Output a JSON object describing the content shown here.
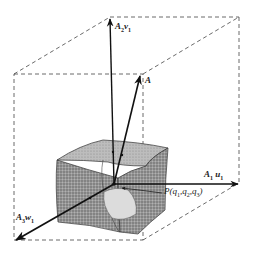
{
  "figure": {
    "labels": {
      "a2v1": {
        "main": "A",
        "sub": "2",
        "vec": "v",
        "vsub": "1"
      },
      "a": {
        "main": "A"
      },
      "a1u1": {
        "main": "A",
        "sub": "1",
        "vec": "u",
        "vsub": "1"
      },
      "point_p": {
        "text": "P(q",
        "q1": "1",
        "q2": "2",
        "q3": "3"
      },
      "a3w1": {
        "main": "A",
        "sub": "3",
        "vec": "w",
        "vsub": "1"
      }
    },
    "colors": {
      "line": "#1a1a1a",
      "dash": "#444444",
      "solid_fill": "#8a8a8a",
      "solid_light": "#c8c8c8"
    }
  }
}
